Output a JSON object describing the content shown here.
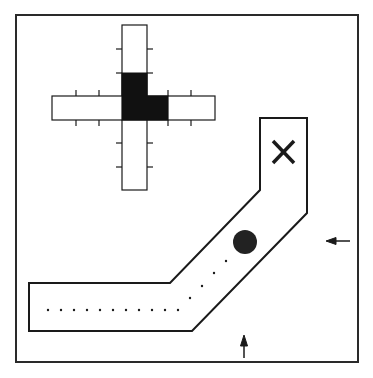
{
  "diagram": {
    "frame": {
      "x": 16,
      "y": 15,
      "w": 342,
      "h": 347
    },
    "colors": {
      "stroke": "#1a1a1a",
      "fill_dark": "#111111",
      "background": "#ffffff",
      "ball": "#222222"
    },
    "cross_map": {
      "vertical_bar": {
        "x": 122,
        "y": 25,
        "w": 25,
        "h": 165
      },
      "horizontal_bar": {
        "x": 52,
        "y": 96,
        "w": 163,
        "h": 24
      },
      "filled_cells": "L-shape at center-right",
      "tick_marks": "evenly spaced tick marks along each arm"
    },
    "corridor": {
      "shape": "bent corridor from lower-left going right then diagonal up-right then vertical up",
      "goal_marker": "X",
      "agent": "dark circle"
    },
    "arrows": [
      {
        "name": "left-arrow",
        "direction": "left"
      },
      {
        "name": "up-arrow",
        "direction": "up"
      }
    ]
  }
}
